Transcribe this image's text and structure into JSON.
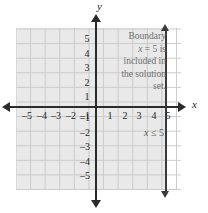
{
  "figure": {
    "axis_labels": {
      "x": "x",
      "y": "y"
    },
    "note_lines": [
      "Boundary",
      "x = 5 is",
      "included in",
      "the solution",
      "set."
    ],
    "note_text": "Boundary x = 5 is included in the solution set.",
    "inequality_label": "x ≤ 5",
    "colors": {
      "axis": "#2b2b2b",
      "grid": "#c9c9c9",
      "shading": "#e9e9e9",
      "boundary_line": "#3a3a3a",
      "note_text": "#6e6e6e",
      "background": "#ffffff"
    }
  },
  "chart_data": {
    "type": "line",
    "title": "",
    "xlabel": "x",
    "ylabel": "y",
    "xlim": [
      -5.5,
      5.5
    ],
    "ylim": [
      -5.5,
      5.5
    ],
    "grid": true,
    "legend": null,
    "xticks": [
      -5,
      -4,
      -3,
      -2,
      -1,
      1,
      2,
      3,
      4,
      5
    ],
    "xtick_labels": [
      "–5",
      "–4",
      "–3",
      "–2",
      "–1",
      "1",
      "2",
      "3",
      "4",
      "5"
    ],
    "yticks": [
      5,
      4,
      3,
      2,
      1,
      -1,
      -2,
      -3,
      -4,
      -5
    ],
    "ytick_labels": [
      "5",
      "4",
      "3",
      "2",
      "1",
      "–1",
      "–2",
      "–3",
      "–4",
      "–5"
    ],
    "series": [
      {
        "name": "boundary",
        "kind": "vertical-line",
        "x": 5,
        "style": "solid",
        "included": true,
        "label": "x = 5"
      },
      {
        "name": "solution-region",
        "kind": "half-plane-shading",
        "inequality": "x ≤ 5",
        "shaded_side": "left",
        "x_range": [
          -5.5,
          5
        ]
      }
    ],
    "annotations": [
      {
        "text": "Boundary x = 5 is included in the solution set.",
        "position": "upper-right"
      },
      {
        "text": "x ≤ 5",
        "position": "lower-right"
      }
    ]
  },
  "ticks": {
    "x": [
      {
        "label": "–5",
        "left": 18,
        "top": 110
      },
      {
        "label": "–4",
        "left": 33,
        "top": 110
      },
      {
        "label": "–3",
        "left": 47,
        "top": 110
      },
      {
        "label": "–2",
        "left": 62,
        "top": 110
      },
      {
        "label": "–1",
        "left": 76,
        "top": 110
      },
      {
        "label": "1",
        "left": 102,
        "top": 110
      },
      {
        "label": "2",
        "left": 117,
        "top": 110
      },
      {
        "label": "3",
        "left": 131,
        "top": 110
      },
      {
        "label": "4",
        "left": 146,
        "top": 110
      },
      {
        "label": "5",
        "left": 160,
        "top": 110
      }
    ],
    "y": [
      {
        "label": "5",
        "left": 79,
        "top": 33
      },
      {
        "label": "4",
        "left": 79,
        "top": 48
      },
      {
        "label": "3",
        "left": 79,
        "top": 62
      },
      {
        "label": "2",
        "left": 79,
        "top": 77
      },
      {
        "label": "1",
        "left": 79,
        "top": 91
      },
      {
        "label": "–1",
        "left": 76,
        "top": 112
      },
      {
        "label": "–2",
        "left": 76,
        "top": 127
      },
      {
        "label": "–3",
        "left": 76,
        "top": 141
      },
      {
        "label": "–4",
        "left": 76,
        "top": 156
      },
      {
        "label": "–5",
        "left": 76,
        "top": 170
      }
    ]
  }
}
